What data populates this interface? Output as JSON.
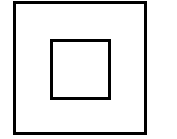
{
  "diagram": {
    "symbol": "double-insulation-square-icon",
    "stroke_color": "#000000",
    "background_color": "#ffffff",
    "shapes": [
      {
        "name": "outer-square",
        "x": 13,
        "y": 1,
        "size": 134
      },
      {
        "name": "inner-square",
        "x": 50,
        "y": 39,
        "size": 61
      }
    ]
  }
}
